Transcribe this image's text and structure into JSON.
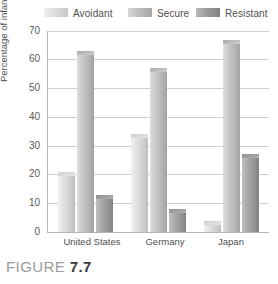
{
  "figure": {
    "caption_prefix": "FIGURE",
    "caption_number": "7.7"
  },
  "legend": {
    "position": "top",
    "items": [
      {
        "label": "Avoidant",
        "color": "#dcdcdc"
      },
      {
        "label": "Secure",
        "color": "#bdbdbd"
      },
      {
        "label": "Resistant",
        "color": "#9a9a9a"
      }
    ]
  },
  "axes": {
    "ylabel": "Percentage of infants",
    "xlabel": "",
    "yticks": [
      "70",
      "60",
      "50",
      "40",
      "30",
      "20",
      "10",
      "0"
    ],
    "categories": [
      "United States",
      "Germany",
      "Japan"
    ]
  },
  "chart_data": {
    "type": "bar",
    "title": "",
    "subtitle": "",
    "xlabel": "",
    "ylabel": "Percentage of infants",
    "categories": [
      "United States",
      "Germany",
      "Japan"
    ],
    "series": [
      {
        "name": "Avoidant",
        "values": [
          21,
          34,
          4
        ],
        "color": "#dcdcdc"
      },
      {
        "name": "Secure",
        "values": [
          63,
          57,
          67
        ],
        "color": "#bdbdbd"
      },
      {
        "name": "Resistant",
        "values": [
          13,
          8,
          27
        ],
        "color": "#9a9a9a"
      }
    ],
    "ylim": [
      0,
      70
    ],
    "ytick_step": 10,
    "grid": true,
    "legend_position": "top"
  }
}
